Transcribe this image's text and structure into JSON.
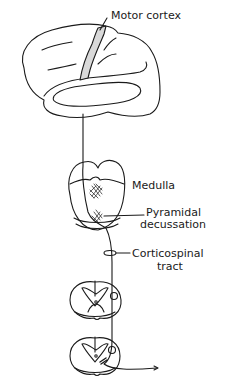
{
  "diagram": {
    "labels": {
      "motor_cortex": "Motor cortex",
      "medulla": "Medulla",
      "pyramidal_line1": "Pyramidal",
      "pyramidal_line2": "decussation",
      "corticospinal_line1": "Corticospinal",
      "corticospinal_line2": "tract"
    },
    "colors": {
      "line": "#1a1a1a",
      "motor_cortex_fill": "#d9d9d9",
      "background": "#ffffff"
    }
  }
}
